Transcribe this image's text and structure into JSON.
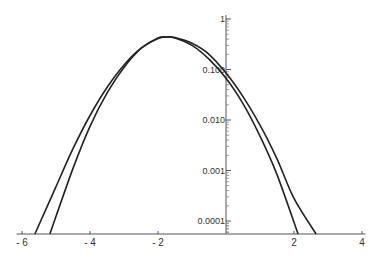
{
  "chart_data": {
    "type": "line",
    "title": "",
    "xlabel": "",
    "ylabel": "",
    "xlim": [
      -6.1,
      4.1
    ],
    "ylim": [
      5e-05,
      1.0
    ],
    "yscale": "log",
    "grid": false,
    "legend": "none",
    "x_ticks": [
      {
        "value": -6,
        "label": "- 6"
      },
      {
        "value": -4,
        "label": "- 4"
      },
      {
        "value": -2,
        "label": "- 2"
      },
      {
        "value": 2,
        "label": "2"
      },
      {
        "value": 4,
        "label": "4"
      }
    ],
    "y_ticks": [
      {
        "value": 1,
        "label": "1"
      },
      {
        "value": 0.1,
        "label": "0.100"
      },
      {
        "value": 0.01,
        "label": "0.010"
      },
      {
        "value": 0.001,
        "label": "0.001"
      },
      {
        "value": 0.0001,
        "label": "0.0001"
      }
    ],
    "series": [
      {
        "name": "curve-a",
        "x": [
          -5.62,
          -5.0,
          -4.5,
          -4.0,
          -3.5,
          -3.0,
          -2.5,
          -2.0,
          -1.75,
          -1.5,
          -1.0,
          -0.5,
          0.0,
          0.5,
          1.0,
          1.5,
          2.12
        ],
        "y": [
          5e-05,
          0.00048,
          0.0027,
          0.0123,
          0.044,
          0.123,
          0.264,
          0.42,
          0.44,
          0.42,
          0.3,
          0.16,
          0.067,
          0.021,
          0.0048,
          0.00083,
          5e-05
        ]
      },
      {
        "name": "curve-b",
        "x": [
          -5.18,
          -4.5,
          -4.0,
          -3.5,
          -3.0,
          -2.5,
          -2.0,
          -1.75,
          -1.5,
          -1.0,
          -0.5,
          0.0,
          0.5,
          1.0,
          1.5,
          2.0,
          2.65
        ],
        "y": [
          5e-05,
          0.0011,
          0.0075,
          0.034,
          0.11,
          0.26,
          0.41,
          0.44,
          0.43,
          0.33,
          0.2,
          0.085,
          0.029,
          0.0079,
          0.0017,
          0.00028,
          5e-05
        ]
      }
    ]
  }
}
